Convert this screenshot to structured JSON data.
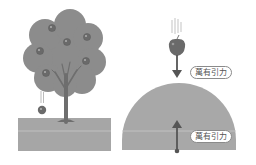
{
  "diagram": {
    "left_panel": {
      "description": "Apple tree with a falling apple onto the ground",
      "tree_apples_count": 6,
      "falling_apple": true
    },
    "right_panel": {
      "top_label": "萬有引力",
      "bottom_label": "萬有引力",
      "description": "Apple pulled down toward Earth; Earth pulled up toward apple"
    },
    "colors": {
      "tree_canopy": "#8c8c8c",
      "trunk": "#6e6e6e",
      "apple": "#6a6a6a",
      "ground": "#a6a6a6",
      "earth": "#a8a8a8",
      "arrow": "#555555",
      "label_border": "#8a8a8a"
    }
  }
}
